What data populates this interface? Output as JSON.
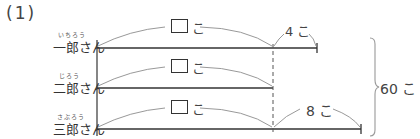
{
  "problem": {
    "number": "(1)"
  },
  "people": [
    {
      "ruby": "いちろう",
      "name": "一郎さん"
    },
    {
      "ruby": "じろう",
      "name": "二郎さん"
    },
    {
      "ruby": "さぶろう",
      "name": "三郎さん"
    }
  ],
  "unknown_labels": [
    {
      "unit": "こ"
    },
    {
      "unit": "こ"
    },
    {
      "unit": "こ"
    }
  ],
  "extra_labels": {
    "ichiro": "4 こ",
    "saburo": "8 こ"
  },
  "total_label": "60 こ"
}
